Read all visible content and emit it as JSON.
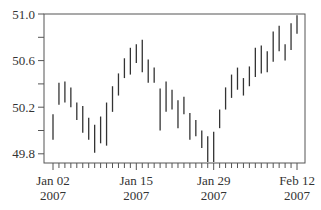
{
  "chart_data": {
    "type": "bar",
    "subtype": "high-low range bars",
    "title": "",
    "xlabel": "",
    "ylabel": "",
    "ylim": [
      49.7,
      51.0
    ],
    "yticks": [
      49.8,
      50.2,
      50.6,
      51.0
    ],
    "ytick_labels": [
      "49.8",
      "50.2",
      "50.6",
      "51.0"
    ],
    "yminor_ticks": [
      50.0,
      50.4,
      50.8
    ],
    "xtick_labels": [
      {
        "line1": "Jan 02",
        "line2": "2007"
      },
      {
        "line1": "Jan 15",
        "line2": "2007"
      },
      {
        "line1": "Jan 29",
        "line2": "2007"
      },
      {
        "line1": "Feb 12",
        "line2": "2007"
      }
    ],
    "grid": false,
    "legend": null,
    "bar_color": "#333333",
    "series": [
      {
        "name": "price range",
        "high": [
          50.14,
          50.41,
          50.42,
          50.37,
          50.24,
          50.21,
          50.11,
          50.05,
          50.12,
          50.24,
          50.38,
          50.49,
          50.62,
          50.71,
          50.74,
          50.78,
          50.61,
          50.54,
          50.36,
          50.42,
          50.35,
          50.26,
          50.29,
          50.15,
          50.09,
          50.0,
          49.95,
          49.99,
          50.18,
          50.37,
          50.48,
          50.54,
          50.45,
          50.55,
          50.71,
          50.73,
          50.68,
          50.85,
          50.9,
          50.74,
          50.92,
          50.99
        ],
        "low": [
          49.92,
          50.22,
          50.24,
          50.2,
          50.09,
          49.98,
          49.92,
          49.81,
          49.89,
          49.87,
          50.16,
          50.3,
          50.45,
          50.48,
          50.58,
          50.5,
          50.41,
          50.41,
          50.0,
          50.16,
          50.18,
          50.02,
          50.14,
          49.92,
          49.95,
          49.85,
          49.73,
          49.73,
          50.02,
          50.18,
          50.28,
          50.35,
          50.3,
          50.38,
          50.46,
          50.49,
          50.5,
          50.59,
          50.68,
          50.6,
          50.69,
          50.83
        ]
      }
    ],
    "labeled_bar_indices": [
      0,
      14,
      27,
      41
    ]
  }
}
